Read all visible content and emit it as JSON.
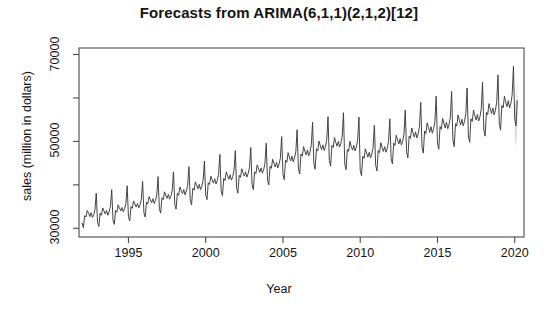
{
  "chart_data": {
    "type": "line",
    "title": "Forecasts from ARIMA(6,1,1)(2,1,2)[12]",
    "xlabel": "Year",
    "ylabel": "sales (million in dollars)",
    "xlim": [
      1991.8,
      2020.6
    ],
    "ylim": [
      28000,
      71500
    ],
    "grid": false,
    "legend": null,
    "xticks": [
      1995,
      2000,
      2005,
      2010,
      2015,
      2020
    ],
    "xtick_labels": [
      "1995",
      "2000",
      "2005",
      "2010",
      "2015",
      "2020"
    ],
    "yticks": [
      30000,
      40000,
      50000,
      60000,
      70000
    ],
    "ytick_labels": [
      "30000",
      "",
      "50000",
      "",
      "70000"
    ],
    "series": [
      {
        "name": "observed sales",
        "color": "#3b3b3b",
        "type": "line",
        "x_start": 1992.0,
        "x_end": 2019.92,
        "frequency_per_year": 12,
        "values": [
          31200,
          30150,
          32900,
          32600,
          34100,
          33500,
          32700,
          33600,
          32500,
          33100,
          34300,
          38100,
          31400,
          30400,
          33500,
          33000,
          34700,
          34000,
          33300,
          34100,
          33000,
          33800,
          35000,
          38900,
          31900,
          30900,
          34100,
          33700,
          35400,
          34700,
          34000,
          34800,
          33800,
          34500,
          35700,
          39800,
          32700,
          31700,
          35000,
          34600,
          36300,
          35600,
          34900,
          35700,
          34700,
          35400,
          36700,
          40800,
          33600,
          32600,
          36000,
          35600,
          37300,
          36600,
          35900,
          36800,
          35700,
          36400,
          37700,
          41900,
          34500,
          33500,
          37000,
          36600,
          38400,
          37600,
          36900,
          37800,
          36700,
          37500,
          38800,
          43000,
          35400,
          34400,
          38100,
          37600,
          39500,
          38700,
          38000,
          38900,
          37700,
          38600,
          39900,
          44200,
          36500,
          35400,
          39200,
          38800,
          40700,
          39900,
          39100,
          40100,
          38900,
          39700,
          41100,
          45500,
          37700,
          36600,
          40500,
          40100,
          42000,
          41200,
          40400,
          41400,
          40200,
          41000,
          42400,
          47000,
          38600,
          37500,
          41500,
          41000,
          43000,
          42100,
          41300,
          42300,
          41100,
          41900,
          43300,
          47900,
          39200,
          38100,
          42200,
          41700,
          43700,
          42800,
          42000,
          43000,
          41800,
          42600,
          44000,
          48600,
          40000,
          38900,
          43000,
          42600,
          44600,
          43700,
          42900,
          43900,
          42700,
          43500,
          44900,
          49600,
          41100,
          40000,
          44300,
          43800,
          45900,
          45000,
          44100,
          45200,
          43900,
          44800,
          46200,
          51100,
          42400,
          41200,
          45700,
          45200,
          47400,
          46400,
          45500,
          46600,
          45300,
          46200,
          47700,
          52700,
          43700,
          42500,
          47100,
          46600,
          48800,
          47800,
          46900,
          48000,
          46700,
          47600,
          49200,
          54400,
          44900,
          43600,
          48300,
          47800,
          50100,
          49000,
          48100,
          49200,
          47900,
          48800,
          50400,
          55700,
          45600,
          44300,
          49100,
          48600,
          50900,
          49800,
          48900,
          50000,
          48700,
          49600,
          51200,
          56600,
          44800,
          43500,
          48200,
          47700,
          50000,
          48900,
          48000,
          49100,
          47800,
          48700,
          50300,
          55600,
          43300,
          42100,
          46600,
          46100,
          48300,
          47300,
          46400,
          47500,
          46200,
          47100,
          48600,
          53700,
          44500,
          43200,
          47900,
          47400,
          49700,
          48600,
          47700,
          48800,
          47500,
          48400,
          50000,
          55200,
          46100,
          44800,
          49600,
          49100,
          51400,
          50400,
          49400,
          50600,
          49200,
          50100,
          51800,
          57200,
          47600,
          46200,
          51200,
          50700,
          53100,
          52000,
          51000,
          52200,
          50800,
          51700,
          53400,
          59000,
          48700,
          47300,
          52400,
          51800,
          54300,
          53200,
          52100,
          53400,
          51900,
          52900,
          54600,
          60400,
          49600,
          48200,
          53400,
          52800,
          55300,
          54200,
          53100,
          54400,
          52900,
          53900,
          55600,
          61500,
          50300,
          48800,
          54100,
          53500,
          56100,
          54900,
          53800,
          55100,
          53600,
          54600,
          56400,
          62300,
          51300,
          49800,
          55200,
          54600,
          57200,
          56000,
          54900,
          56200,
          54700,
          55700,
          57500,
          63600,
          52700,
          51200,
          56700,
          56100,
          58700,
          57500,
          56400,
          57700,
          56100,
          57200,
          59000,
          65300,
          54200,
          52600,
          58300,
          57700,
          60400,
          59100,
          58000,
          59400,
          57700,
          58800,
          60700,
          67200
        ]
      },
      {
        "name": "point forecast",
        "color": "#3b3b3b",
        "type": "forecast-line",
        "x_start": 2020.0,
        "x_end": 2020.33,
        "values": [
          55200,
          53600,
          59400
        ]
      }
    ],
    "prediction_interval": {
      "name": "80/95% prediction interval",
      "color": "#bdbdbd",
      "x_start": 2020.0,
      "x_end": 2020.33,
      "lower": [
        50500,
        48800,
        54200
      ],
      "upper": [
        60100,
        58600,
        64700
      ]
    },
    "annotations": []
  }
}
